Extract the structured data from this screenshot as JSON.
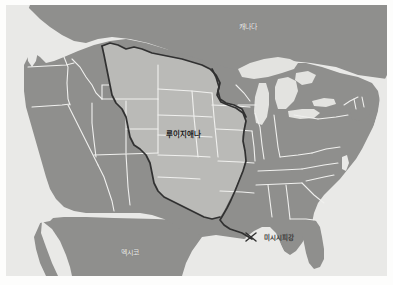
{
  "figure": {
    "kind": "map",
    "title_visible": false,
    "region": "United States",
    "style": "grayscale historical reference map"
  },
  "colors": {
    "page_background": "#ffffff",
    "ocean_background": "#e9e9e7",
    "state_fill": "#8b8b89",
    "state_border": "#f0f0ee",
    "highlight_fill": "#b8b8b5",
    "highlight_outline": "#2a2a2a",
    "river_line": "#2a2a2a",
    "lake_fill": "#e2e2df",
    "canada_fill": "#8b8b89",
    "mexico_fill": "#8b8b89",
    "label_light": "#f2f2f0",
    "label_dark": "#1f1f1f"
  },
  "labels": {
    "canada": "캐나다",
    "louisiana_purchase": "루이지애나",
    "mexico": "멕시코",
    "mississippi_river": "미시시피강"
  },
  "map_features": {
    "highlighted_territory": "루이지애나",
    "river": "미시시피강",
    "neighbors": [
      "캐나다",
      "멕시코"
    ],
    "water_bodies_shown": [
      "Great Lakes",
      "Gulf of Mexico",
      "Pacific Ocean",
      "Atlantic Ocean"
    ]
  }
}
